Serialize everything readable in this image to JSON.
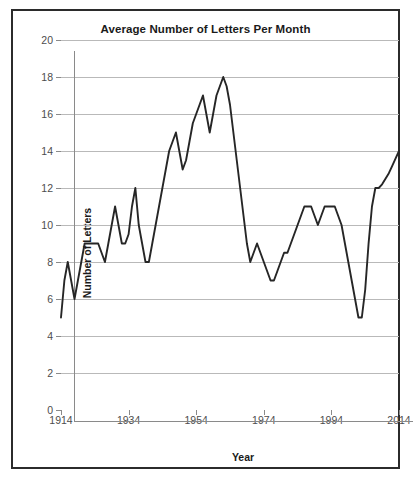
{
  "chart_data": {
    "type": "line",
    "title": "Average Number of Letters Per Month",
    "xlabel": "Year",
    "ylabel": "Number of Letters",
    "grid": true,
    "legend": "none",
    "xlim": [
      1914,
      2014
    ],
    "ylim": [
      0,
      20
    ],
    "ytick_labels": [
      "20",
      "18",
      "16",
      "14",
      "12",
      "10",
      "8",
      "6",
      "4",
      "2",
      "0"
    ],
    "ytick_values": [
      20,
      18,
      16,
      14,
      12,
      10,
      8,
      6,
      4,
      2,
      0
    ],
    "xtick_labels": [
      "1914",
      "1934",
      "1954",
      "1974",
      "1994",
      "2014"
    ],
    "xtick_values": [
      1914,
      1934,
      1954,
      1974,
      1994,
      2014
    ],
    "series_name": "Average Number of Letters Per Month",
    "line_color": "#262626",
    "x": [
      1914,
      1915,
      1916,
      1917,
      1918,
      1919,
      1920,
      1921,
      1922,
      1923,
      1924,
      1925,
      1926,
      1927,
      1928,
      1929,
      1930,
      1931,
      1932,
      1933,
      1934,
      1935,
      1936,
      1937,
      1938,
      1939,
      1940,
      1941,
      1942,
      1943,
      1944,
      1945,
      1946,
      1947,
      1948,
      1949,
      1950,
      1951,
      1952,
      1953,
      1954,
      1955,
      1956,
      1957,
      1958,
      1959,
      1960,
      1961,
      1962,
      1963,
      1964,
      1965,
      1966,
      1967,
      1968,
      1969,
      1970,
      1971,
      1972,
      1973,
      1974,
      1975,
      1976,
      1977,
      1978,
      1979,
      1980,
      1981,
      1982,
      1983,
      1984,
      1985,
      1986,
      1987,
      1988,
      1989,
      1990,
      1991,
      1992,
      1993,
      1994,
      1995,
      1996,
      1997,
      1998,
      1999,
      2000,
      2001,
      2002,
      2003,
      2004,
      2005,
      2006,
      2007,
      2008,
      2009,
      2010,
      2011,
      2012,
      2013,
      2014
    ],
    "values": [
      5,
      7,
      8,
      7,
      6,
      7,
      8,
      9,
      9,
      9,
      9,
      9,
      8.5,
      8,
      9,
      10,
      11,
      10,
      9,
      9,
      9.5,
      11,
      12,
      10,
      9,
      8,
      8,
      9,
      10,
      11,
      12,
      13,
      14,
      14.5,
      15,
      14,
      13,
      13.5,
      14.5,
      15.5,
      16,
      16.5,
      17,
      16,
      15,
      16,
      17,
      17.5,
      18,
      17.5,
      16.5,
      15,
      13.5,
      12,
      10.5,
      9,
      8,
      8.5,
      9,
      8.5,
      8,
      7.5,
      7,
      7,
      7.5,
      8,
      8.5,
      8.5,
      9,
      9.5,
      10,
      10.5,
      11,
      11,
      11,
      10.5,
      10,
      10.5,
      11,
      11,
      11,
      11,
      10.5,
      10,
      9,
      8,
      7,
      6,
      5,
      5,
      6.5,
      9,
      11,
      12,
      12,
      12.2,
      12.5,
      12.8,
      13.2,
      13.6,
      14
    ]
  }
}
